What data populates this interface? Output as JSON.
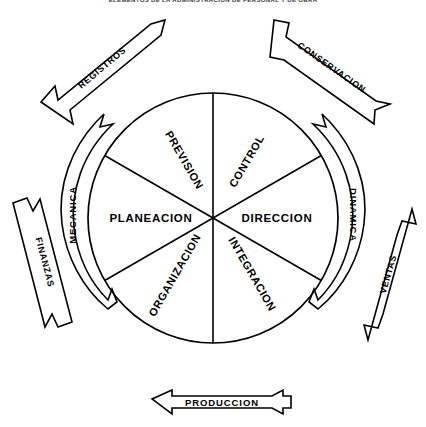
{
  "header": {
    "title": "ELEMENTOS DE LA ADMINISTRACION DE PERSONAL Y DE OBRA"
  },
  "diagram": {
    "type": "cycle-wheel",
    "title": "Elementos de la administracion",
    "center_label": "",
    "wheel": {
      "shape": "circle",
      "segments": [
        {
          "id": "prevision",
          "label": "PREVISION",
          "angle_deg": 300,
          "group": "mecanica"
        },
        {
          "id": "control",
          "label": "CONTROL",
          "angle_deg": 240,
          "group": "dinamica"
        },
        {
          "id": "direccion",
          "label": "DIRECCION",
          "angle_deg": 180,
          "group": "dinamica"
        },
        {
          "id": "integracion",
          "label": "INTEGRACION",
          "angle_deg": 120,
          "group": "dinamica"
        },
        {
          "id": "organizacion",
          "label": "ORGANIZACION",
          "angle_deg": 60,
          "group": "mecanica"
        },
        {
          "id": "planeacion",
          "label": "PLANEACION",
          "angle_deg": 0,
          "group": "mecanica"
        }
      ]
    },
    "curved_arrows": [
      {
        "id": "mecanica",
        "label": "MECANICA",
        "side": "left",
        "heads": "double"
      },
      {
        "id": "dinamica",
        "label": "DINAMICA",
        "side": "right",
        "heads": "double"
      }
    ],
    "banners": [
      {
        "id": "registros",
        "label": "REGISTROS",
        "position": "top-left",
        "direction": "up-right"
      },
      {
        "id": "conservacion",
        "label": "CONSERVACION",
        "position": "top-right",
        "direction": "up-left"
      },
      {
        "id": "finanzas",
        "label": "FINANZAS",
        "position": "bottom-left",
        "direction": "up-left"
      },
      {
        "id": "ventas",
        "label": "VENTAS",
        "position": "bottom-right",
        "direction": "up-right"
      },
      {
        "id": "produccion",
        "label": "PRODUCCION",
        "position": "bottom",
        "direction": "left"
      }
    ]
  },
  "colors": {
    "ink": "#000000",
    "paper": "#ffffff",
    "header_ink": "#3a3a3a"
  }
}
